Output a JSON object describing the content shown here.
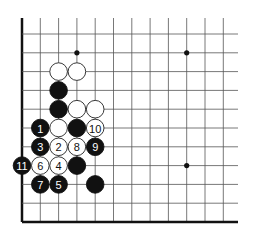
{
  "diagram": {
    "type": "go-board-fragment",
    "grid": {
      "x0": 22,
      "y0": 34,
      "dx": 18.3,
      "dy": 18.8,
      "cols": 12,
      "rows": 11,
      "right_extend": 238,
      "top_extend": 18,
      "left_edge_thick": true,
      "bottom_edge_thick": true
    },
    "star_points": [
      {
        "col": 3,
        "row": 1
      },
      {
        "col": 9,
        "row": 1
      },
      {
        "col": 9,
        "row": 7
      }
    ],
    "stones": [
      {
        "color": "white",
        "col": 2,
        "row": 2,
        "label": ""
      },
      {
        "color": "white",
        "col": 3,
        "row": 2,
        "label": ""
      },
      {
        "color": "black",
        "col": 2,
        "row": 3,
        "label": ""
      },
      {
        "color": "black",
        "col": 2,
        "row": 4,
        "label": ""
      },
      {
        "color": "white",
        "col": 3,
        "row": 4,
        "label": ""
      },
      {
        "color": "white",
        "col": 4,
        "row": 4,
        "label": ""
      },
      {
        "color": "black",
        "col": 1,
        "row": 5,
        "label": "1"
      },
      {
        "color": "white",
        "col": 2,
        "row": 5,
        "label": ""
      },
      {
        "color": "black",
        "col": 3,
        "row": 5,
        "label": ""
      },
      {
        "color": "white",
        "col": 4,
        "row": 5,
        "label": "10"
      },
      {
        "color": "black",
        "col": 1,
        "row": 6,
        "label": "3"
      },
      {
        "color": "white",
        "col": 2,
        "row": 6,
        "label": "2"
      },
      {
        "color": "white",
        "col": 3,
        "row": 6,
        "label": "8"
      },
      {
        "color": "black",
        "col": 4,
        "row": 6,
        "label": "9"
      },
      {
        "color": "black",
        "col": 0,
        "row": 7,
        "label": "11"
      },
      {
        "color": "white",
        "col": 1,
        "row": 7,
        "label": "6"
      },
      {
        "color": "white",
        "col": 2,
        "row": 7,
        "label": "4"
      },
      {
        "color": "black",
        "col": 3,
        "row": 7,
        "label": ""
      },
      {
        "color": "black",
        "col": 1,
        "row": 8,
        "label": "7"
      },
      {
        "color": "black",
        "col": 2,
        "row": 8,
        "label": "5"
      },
      {
        "color": "black",
        "col": 4,
        "row": 8,
        "label": ""
      }
    ],
    "colors": {
      "line": "#555555",
      "edge": "#111111",
      "black_stone": "#111111",
      "white_stone": "#ffffff",
      "white_stone_border": "#222222",
      "black_label": "#ffffff",
      "white_label": "#111111"
    }
  }
}
